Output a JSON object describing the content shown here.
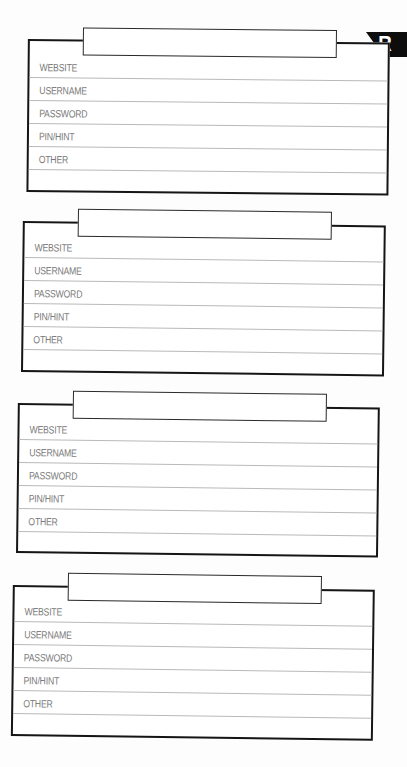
{
  "page": {
    "letter_index": "R",
    "colors": {
      "border": "#151515",
      "row_line": "#b9b9b9",
      "label_text": "#7a7a7a",
      "flag_bg": "#0d0d0d",
      "flag_text": "#ffffff"
    }
  },
  "cards": [
    {
      "title_value": "",
      "fields": [
        {
          "label": "WEBSITE",
          "value": ""
        },
        {
          "label": "USERNAME",
          "value": ""
        },
        {
          "label": "PASSWORD",
          "value": ""
        },
        {
          "label": "PIN/HINT",
          "value": ""
        },
        {
          "label": "OTHER",
          "value": ""
        }
      ]
    },
    {
      "title_value": "",
      "fields": [
        {
          "label": "WEBSITE",
          "value": ""
        },
        {
          "label": "USERNAME",
          "value": ""
        },
        {
          "label": "PASSWORD",
          "value": ""
        },
        {
          "label": "PIN/HINT",
          "value": ""
        },
        {
          "label": "OTHER",
          "value": ""
        }
      ]
    },
    {
      "title_value": "",
      "fields": [
        {
          "label": "WEBSITE",
          "value": ""
        },
        {
          "label": "USERNAME",
          "value": ""
        },
        {
          "label": "PASSWORD",
          "value": ""
        },
        {
          "label": "PIN/HINT",
          "value": ""
        },
        {
          "label": "OTHER",
          "value": ""
        }
      ]
    },
    {
      "title_value": "",
      "fields": [
        {
          "label": "WEBSITE",
          "value": ""
        },
        {
          "label": "USERNAME",
          "value": ""
        },
        {
          "label": "PASSWORD",
          "value": ""
        },
        {
          "label": "PIN/HINT",
          "value": ""
        },
        {
          "label": "OTHER",
          "value": ""
        }
      ]
    }
  ]
}
